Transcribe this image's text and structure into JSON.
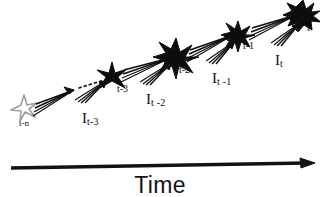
{
  "figure": {
    "title": "",
    "background_color": "#ffffff",
    "ink_color": "#0d0d0d",
    "faded_color": "#9a9a9a",
    "axis": {
      "label": "Time",
      "direction": "left-to-right",
      "arrow_name": "time-arrow"
    },
    "nodes": [
      {
        "id": "t-n",
        "label": "t-n",
        "style": "outline",
        "size": 17,
        "points": 6,
        "x": 24,
        "y": 108,
        "label_x": 19,
        "label_y": 119,
        "label_size": 9
      },
      {
        "id": "t-3",
        "label": "t-3",
        "style": "solid",
        "size": 18,
        "points": 6,
        "x": 112,
        "y": 76,
        "label_x": 117,
        "label_y": 84,
        "label_size": 10
      },
      {
        "id": "t-2",
        "label": "t-2",
        "style": "solid",
        "size": 23,
        "points": 8,
        "x": 176,
        "y": 56,
        "label_x": 179,
        "label_y": 65,
        "label_size": 10
      },
      {
        "id": "t-1",
        "label": "t-1",
        "style": "solid",
        "size": 17,
        "points": 8,
        "x": 238,
        "y": 33,
        "label_x": 243,
        "label_y": 41,
        "label_size": 10
      },
      {
        "id": "t",
        "label": "t",
        "style": "solid",
        "size": 19,
        "points": 12,
        "x": 303,
        "y": 13,
        "label_x": 307,
        "label_y": 23,
        "label_size": 10
      }
    ],
    "input_labels": [
      {
        "id": "I_t-3",
        "base": "I",
        "sub": "t-3",
        "x": 82,
        "y": 110
      },
      {
        "id": "I_t-2",
        "base": "I",
        "sub": "t -2",
        "x": 146,
        "y": 91
      },
      {
        "id": "I_t-1",
        "base": "I",
        "sub": "t -1",
        "x": 212,
        "y": 70
      },
      {
        "id": "I_t",
        "base": "I",
        "sub": "t",
        "x": 275,
        "y": 52
      }
    ],
    "connections": [
      {
        "from": "t-n",
        "to": "t-3",
        "style": "dotted",
        "name": "propagation-t-n-to-t-3"
      },
      {
        "from": "t-3",
        "to": "t-2",
        "style": "solid",
        "name": "propagation-t-3-to-t-2"
      },
      {
        "from": "t-2",
        "to": "t-1",
        "style": "solid",
        "name": "propagation-t-2-to-t-1"
      },
      {
        "from": "t-1",
        "to": "t",
        "style": "solid",
        "name": "propagation-t-1-to-t"
      }
    ],
    "input_arrows": [
      {
        "into": "t-3",
        "name": "input-arrow-t-3"
      },
      {
        "into": "t-2",
        "name": "input-arrow-t-2"
      },
      {
        "into": "t-1",
        "name": "input-arrow-t-1"
      },
      {
        "into": "t",
        "name": "input-arrow-t"
      }
    ]
  }
}
